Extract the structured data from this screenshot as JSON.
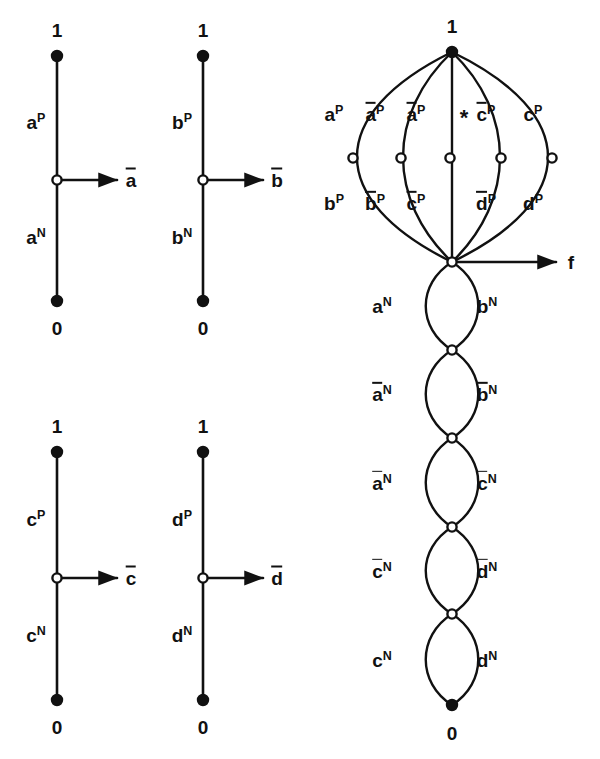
{
  "figure": {
    "type": "diagram",
    "node_types": {
      "filled": "terminal-node",
      "open": "internal-node"
    },
    "terminal_labels": {
      "one": "1",
      "zero": "0"
    }
  },
  "gadgets": [
    {
      "id": "gadget-a",
      "top_terminal": "1",
      "bottom_terminal": "0",
      "upper_edge": {
        "base": "a",
        "sup": "P",
        "overline": false
      },
      "lower_edge": {
        "base": "a",
        "sup": "N",
        "overline": false
      },
      "output": {
        "base": "a",
        "overline": true
      },
      "x": 57,
      "top_y": 56,
      "mid_y": 180,
      "bot_y": 301,
      "arrow_end_x": 117,
      "out_label_x": 124
    },
    {
      "id": "gadget-b",
      "top_terminal": "1",
      "bottom_terminal": "0",
      "upper_edge": {
        "base": "b",
        "sup": "P",
        "overline": false
      },
      "lower_edge": {
        "base": "b",
        "sup": "N",
        "overline": false
      },
      "output": {
        "base": "b",
        "overline": true
      },
      "x": 203,
      "top_y": 56,
      "mid_y": 180,
      "bot_y": 301,
      "arrow_end_x": 263,
      "out_label_x": 270
    },
    {
      "id": "gadget-c",
      "top_terminal": "1",
      "bottom_terminal": "0",
      "upper_edge": {
        "base": "c",
        "sup": "P",
        "overline": false
      },
      "lower_edge": {
        "base": "c",
        "sup": "N",
        "overline": false
      },
      "output": {
        "base": "c",
        "overline": true
      },
      "x": 57,
      "top_y": 452,
      "mid_y": 578,
      "bot_y": 700,
      "arrow_end_x": 117,
      "out_label_x": 124
    },
    {
      "id": "gadget-d",
      "top_terminal": "1",
      "bottom_terminal": "0",
      "upper_edge": {
        "base": "d",
        "sup": "P",
        "overline": false
      },
      "lower_edge": {
        "base": "d",
        "sup": "N",
        "overline": false
      },
      "output": {
        "base": "d",
        "overline": true
      },
      "x": 203,
      "top_y": 452,
      "mid_y": 578,
      "bot_y": 700,
      "arrow_end_x": 263,
      "out_label_x": 270
    }
  ],
  "formula_graph": {
    "id": "formula-graph",
    "top_terminal": "1",
    "bottom_terminal": "0",
    "output": "f",
    "top_node": {
      "x": 452,
      "y": 52
    },
    "hub_node": {
      "x": 452,
      "y": 262
    },
    "bottom_node": {
      "x": 452,
      "y": 705
    },
    "arrow_end_x": 556,
    "output_label_x": 565,
    "asterisk": "*",
    "asterisk_x": 455,
    "asterisk_y": 106,
    "melon_arcs": [
      {
        "mid_x": 353,
        "bulge": -99,
        "upper": {
          "base": "a",
          "sup": "P",
          "overline": false
        },
        "lower": {
          "base": "b",
          "sup": "P",
          "overline": false
        },
        "upper_lx": 334,
        "lower_lx": 334
      },
      {
        "mid_x": 401,
        "bulge": -51,
        "upper": {
          "base": "a",
          "sup": "P",
          "overline": true
        },
        "lower": {
          "base": "b",
          "sup": "P",
          "overline": true
        },
        "upper_lx": 375,
        "lower_lx": 375
      },
      {
        "mid_x": 450,
        "bulge": 0,
        "upper": {
          "base": "a",
          "sup": "P",
          "overline": true
        },
        "lower": {
          "base": "c",
          "sup": "P",
          "overline": true
        },
        "upper_lx": 416,
        "lower_lx": 416
      },
      {
        "mid_x": 501,
        "bulge": 50,
        "upper": {
          "base": "c",
          "sup": "P",
          "overline": true
        },
        "lower": {
          "base": "d",
          "sup": "P",
          "overline": true
        },
        "upper_lx": 486,
        "lower_lx": 486
      },
      {
        "mid_x": 552,
        "bulge": 100,
        "upper": {
          "base": "c",
          "sup": "P",
          "overline": false
        },
        "lower": {
          "base": "d",
          "sup": "P",
          "overline": false
        },
        "upper_lx": 533,
        "lower_lx": 533
      }
    ],
    "chain_lenses": [
      {
        "top_y": 262,
        "bot_y": 350,
        "left": {
          "base": "a",
          "sup": "N",
          "overline": false
        },
        "right": {
          "base": "b",
          "sup": "N",
          "overline": false
        }
      },
      {
        "top_y": 350,
        "bot_y": 438,
        "left": {
          "base": "a",
          "sup": "N",
          "overline": true
        },
        "right": {
          "base": "b",
          "sup": "N",
          "overline": true
        }
      },
      {
        "top_y": 438,
        "bot_y": 527,
        "left": {
          "base": "a",
          "sup": "N",
          "overline": true
        },
        "right": {
          "base": "c",
          "sup": "N",
          "overline": true
        }
      },
      {
        "top_y": 527,
        "bot_y": 614,
        "left": {
          "base": "c",
          "sup": "N",
          "overline": true
        },
        "right": {
          "base": "d",
          "sup": "N",
          "overline": true
        }
      },
      {
        "top_y": 614,
        "bot_y": 705,
        "left": {
          "base": "c",
          "sup": "N",
          "overline": false
        },
        "right": {
          "base": "d",
          "sup": "N",
          "overline": false
        }
      }
    ],
    "chain_label_left_x": 382,
    "chain_label_right_x": 487,
    "chain_half_width": 35
  },
  "colors": {
    "ink": "#111111",
    "paper": "#ffffff",
    "node_fill": "#ffffff"
  }
}
